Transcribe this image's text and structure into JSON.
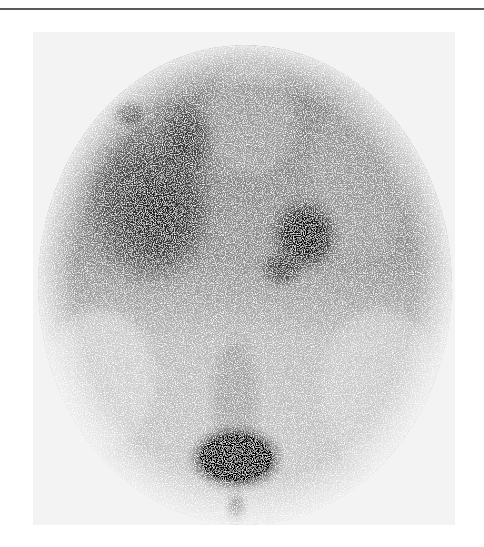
{
  "figure": {
    "type": "nuclear-medicine-scintigram",
    "caption": "",
    "orientation": "anterior",
    "has_text_labels": false
  },
  "colors": {
    "page_background": "#ffffff",
    "top_rule": "#5a5a5a",
    "field_background": "#f3f3f3",
    "fov_upper": "#8a8a8a",
    "fov_lower": "#c8c8c8",
    "hot_spot": "#0a0a0a"
  },
  "regions": [
    {
      "name": "left-large-uptake",
      "cx": 150,
      "cy": 205,
      "rx": 68,
      "ry": 82,
      "intensity": 0.85
    },
    {
      "name": "left-upper-small-uptake",
      "cx": 128,
      "cy": 113,
      "rx": 16,
      "ry": 12,
      "intensity": 0.9
    },
    {
      "name": "upper-midline-uptake",
      "cx": 185,
      "cy": 140,
      "rx": 28,
      "ry": 40,
      "intensity": 0.7
    },
    {
      "name": "right-uptake",
      "cx": 305,
      "cy": 235,
      "rx": 32,
      "ry": 34,
      "intensity": 0.9
    },
    {
      "name": "right-lower-uptake",
      "cx": 282,
      "cy": 268,
      "rx": 22,
      "ry": 18,
      "intensity": 0.75
    },
    {
      "name": "bottom-intense-uptake",
      "cx": 236,
      "cy": 458,
      "rx": 46,
      "ry": 31,
      "intensity": 1.0
    },
    {
      "name": "bottom-tail",
      "cx": 236,
      "cy": 508,
      "rx": 10,
      "ry": 14,
      "intensity": 0.7
    }
  ]
}
